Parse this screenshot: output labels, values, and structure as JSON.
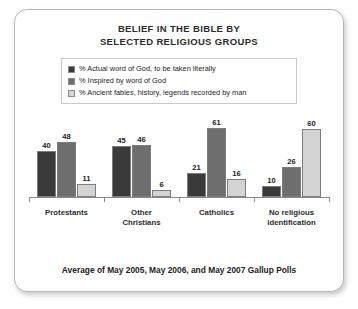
{
  "card": {
    "title_line1": "BELIEF IN THE BIBLE BY",
    "title_line2": "SELECTED RELIGIOUS GROUPS",
    "footer": "Average of May 2005, May 2006, and May 2007 Gallup Polls"
  },
  "colors": {
    "series_dark": "#3a3a3a",
    "series_medium": "#6e6e6e",
    "series_light": "#d4d4d4",
    "card_border": "#b7b7b7",
    "axis": "#8a8a8a",
    "text": "#2b2b2b"
  },
  "legend": {
    "items": [
      {
        "label": "% Actual word of God, to be taken literally",
        "color": "#3a3a3a",
        "swatch_name": "legend-swatch-actual-word"
      },
      {
        "label": "% Inspired by word of God",
        "color": "#6e6e6e",
        "swatch_name": "legend-swatch-inspired"
      },
      {
        "label": "% Ancient fables, history, legends recorded by man",
        "color": "#d4d4d4",
        "swatch_name": "legend-swatch-fables"
      }
    ]
  },
  "categories_display": [
    {
      "line1": "Protestants",
      "line2": ""
    },
    {
      "line1": "Other",
      "line2": "Christians"
    },
    {
      "line1": "Catholics",
      "line2": ""
    },
    {
      "line1": "No religious",
      "line2": "identification"
    }
  ],
  "chart_data": {
    "type": "bar",
    "title": "BELIEF IN THE BIBLE BY SELECTED RELIGIOUS GROUPS",
    "subtitle": "Average of May 2005, May 2006, and May 2007 Gallup Polls",
    "xlabel": "",
    "ylabel": "",
    "ylim": [
      0,
      65
    ],
    "grid": false,
    "legend_position": "top",
    "categories": [
      "Protestants",
      "Other Christians",
      "Catholics",
      "No religious identification"
    ],
    "series": [
      {
        "name": "% Actual word of God, to be taken literally",
        "color": "#3a3a3a",
        "values": [
          40,
          45,
          21,
          10
        ]
      },
      {
        "name": "% Inspired by word of God",
        "color": "#6e6e6e",
        "values": [
          48,
          46,
          61,
          26
        ]
      },
      {
        "name": "% Ancient fables, history, legends recorded by man",
        "color": "#d4d4d4",
        "values": [
          11,
          6,
          16,
          60
        ]
      }
    ]
  }
}
